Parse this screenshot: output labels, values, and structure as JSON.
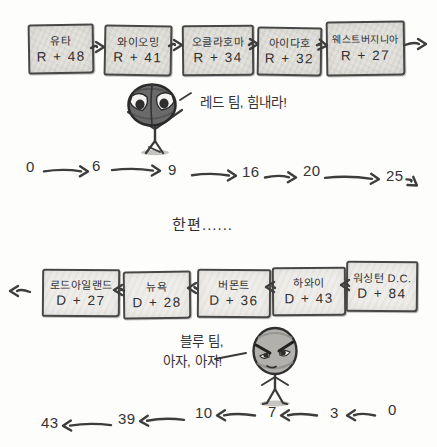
{
  "red_team": {
    "chain": [
      {
        "state": "유타",
        "margin": "R + 48"
      },
      {
        "state": "와이오밍",
        "margin": "R + 41"
      },
      {
        "state": "오클라호마",
        "margin": "R + 34"
      },
      {
        "state": "아이다호",
        "margin": "R + 32"
      },
      {
        "state": "웨스트버지니아",
        "margin": "R + 27"
      }
    ],
    "mascot_speech": "레드 팀, 힘내라!",
    "tally": [
      "0",
      "6",
      "9",
      "16",
      "20",
      "25"
    ]
  },
  "meanwhile_label": "한편......",
  "blue_team": {
    "chain": [
      {
        "state": "로드아일랜드",
        "margin": "D + 27"
      },
      {
        "state": "뉴욕",
        "margin": "D + 28"
      },
      {
        "state": "버몬트",
        "margin": "D + 36"
      },
      {
        "state": "하와이",
        "margin": "D + 43"
      },
      {
        "state": "워싱턴 D.C.",
        "margin": "D + 84"
      }
    ],
    "mascot_speech_line1": "블루 팀,",
    "mascot_speech_line2": "아자, 아자!",
    "tally": [
      "43",
      "39",
      "10",
      "7",
      "3",
      "0"
    ]
  },
  "icons": {
    "flow_right": "→",
    "flow_left": "←"
  },
  "colors": {
    "ink": "#3d3d3d",
    "box_fill_top": "#e4e2dd",
    "box_fill_bottom": "#efede9",
    "background": "#fdfdfb"
  }
}
